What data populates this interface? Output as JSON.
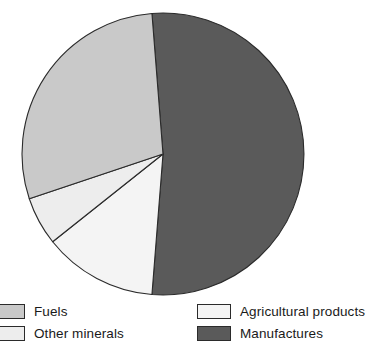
{
  "chart_data": {
    "type": "pie",
    "title": "",
    "subtitle": "",
    "xlabel": "",
    "ylabel": "",
    "legend_position": "bottom",
    "grid": false,
    "categories": [
      "Fuels",
      "Other minerals",
      "Agricultural products",
      "Manufactures"
    ],
    "values": [
      28.9,
      5.6,
      13.1,
      52.4
    ],
    "units": "percent",
    "slices": [
      {
        "label": "Fuels",
        "value": 28.9,
        "color": "#c9c9c9",
        "start_angle_deg": 251.5,
        "end_angle_deg": 355.5
      },
      {
        "label": "Other minerals",
        "value": 5.6,
        "color": "#ededed",
        "start_angle_deg": 231.5,
        "end_angle_deg": 251.5
      },
      {
        "label": "Agricultural products",
        "value": 13.1,
        "color": "#f4f4f4",
        "start_angle_deg": 184.5,
        "end_angle_deg": 231.5
      },
      {
        "label": "Manufactures",
        "value": 52.4,
        "color": "#5a5a5a",
        "start_angle_deg": 355.5,
        "end_angle_deg": 184.5
      }
    ],
    "geometry": {
      "center_x": 163,
      "center_y": 154,
      "radius": 141
    }
  },
  "legend": {
    "left_column": [
      {
        "label": "Fuels",
        "color": "#c9c9c9"
      },
      {
        "label": "Other minerals",
        "color": "#ededed"
      }
    ],
    "right_column": [
      {
        "label": "Agricultural products",
        "color": "#f4f4f4"
      },
      {
        "label": "Manufactures",
        "color": "#5a5a5a"
      }
    ]
  },
  "colors": {
    "outline": "#2b2b2b",
    "background": "#ffffff",
    "text": "#1a1a1a"
  }
}
